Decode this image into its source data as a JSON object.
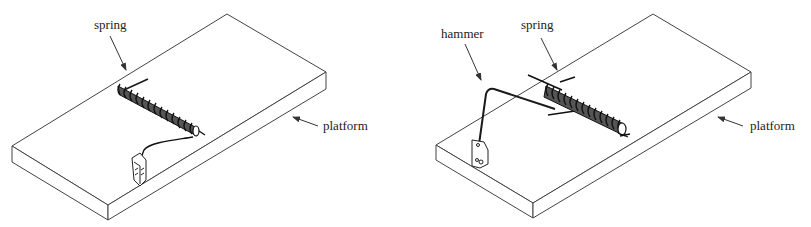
{
  "figure": {
    "panels": [
      {
        "id": "left",
        "labels": {
          "spring": "spring",
          "platform": "platform"
        }
      },
      {
        "id": "right",
        "labels": {
          "hammer": "hammer",
          "spring": "spring",
          "platform": "platform"
        }
      }
    ],
    "colors": {
      "line": "#333333",
      "coil": "#1a1a1a",
      "background": "#ffffff"
    }
  }
}
